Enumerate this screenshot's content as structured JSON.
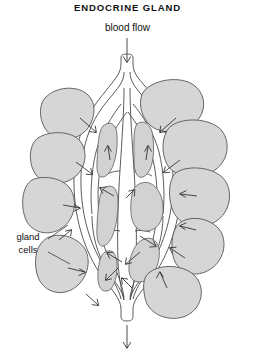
{
  "diagram": {
    "title": "ENDOCRINE GLAND",
    "inlet_label": "blood flow",
    "gland_label_line1": "gland",
    "gland_label_line2": "cells",
    "colors": {
      "background": "#ffffff",
      "cell_fill": "#d6d6d6",
      "cell_stroke": "#555555",
      "vessel_lumen": "#ffffff",
      "vessel_stroke": "#4a4a4a",
      "arrow_stroke": "#2a2a2a",
      "text": "#111111"
    },
    "elements": {
      "inlet_arrow": "down-arrow-icon",
      "outlet_arrow": "down-arrow-icon",
      "secretion_arrows": "arrow-icon",
      "flow_arrows": "arrow-icon",
      "leader_lines": "leader-line"
    }
  }
}
